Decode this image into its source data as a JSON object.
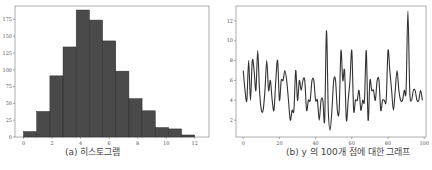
{
  "chart_data": [
    {
      "type": "bar",
      "title": "",
      "caption": "(a) 히스토그램",
      "xlabel": "",
      "ylabel": "",
      "xlim": [
        -0.6,
        13.0
      ],
      "ylim": [
        0,
        195
      ],
      "xticks": [
        0,
        2,
        4,
        6,
        8,
        10,
        12
      ],
      "yticks": [
        0,
        25,
        50,
        75,
        100,
        125,
        150,
        175
      ],
      "bin_edges": [
        0,
        0.923,
        1.846,
        2.769,
        3.692,
        4.615,
        5.538,
        6.462,
        7.385,
        8.308,
        9.231,
        10.154,
        11.077,
        12.0
      ],
      "values": [
        8,
        38,
        91,
        134,
        189,
        174,
        143,
        98,
        57,
        39,
        14,
        12,
        3
      ],
      "bar_color": "#4a4a4a",
      "grid": false
    },
    {
      "type": "line",
      "title": "",
      "caption": "(b) y 의 100개 점에 대한 그래프",
      "xlabel": "",
      "ylabel": "",
      "xlim": [
        -4,
        101
      ],
      "ylim": [
        0.3,
        13.5
      ],
      "xticks": [
        0,
        20,
        40,
        60,
        80,
        100
      ],
      "yticks": [
        2,
        4,
        6,
        8,
        10,
        12
      ],
      "x": "0..99",
      "values": [
        7,
        5,
        4,
        8,
        4,
        8,
        7,
        5,
        9,
        5,
        3,
        3,
        5,
        8,
        5,
        6,
        4,
        3,
        6,
        8,
        4,
        6,
        6,
        7,
        6,
        4,
        2,
        3,
        3,
        7,
        4,
        6,
        5,
        6,
        6,
        3,
        4,
        4,
        6,
        6,
        4,
        4,
        2,
        4,
        4,
        2,
        11,
        3,
        1,
        3,
        6,
        6,
        3,
        3,
        9,
        6,
        7,
        2,
        4,
        6,
        9,
        3,
        4,
        4,
        5,
        3,
        4,
        4,
        9,
        2,
        6,
        5,
        5,
        4,
        6,
        6,
        3,
        4,
        4,
        4,
        9,
        7,
        5,
        3,
        5,
        7,
        5,
        4,
        4,
        5,
        5,
        13,
        5,
        4,
        5,
        5,
        4,
        4,
        5,
        4
      ],
      "line_color": "#333333",
      "grid": false
    }
  ],
  "captions": {
    "left": "(a) 히스토그램",
    "right": "(b) y 의 100개 점에 대한 그래프"
  }
}
